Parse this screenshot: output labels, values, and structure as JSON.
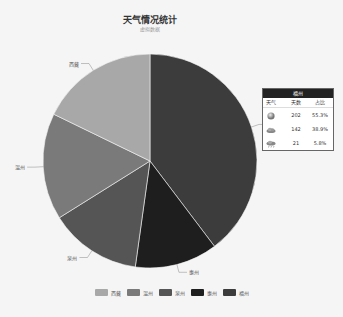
{
  "title": "天气情况统计",
  "subtitle": "虚拟数据",
  "chart_data": {
    "type": "pie",
    "title": "天气情况统计",
    "subtitle": "虚拟数据",
    "categories": [
      "福州",
      "惠州",
      "泉州",
      "温州",
      "西藏"
    ],
    "values": [
      39.7,
      12.5,
      13.9,
      16.1,
      17.8
    ],
    "colors": [
      "#3c3c3c",
      "#1e1e1e",
      "#555555",
      "#7a7a7a",
      "#a8a8a8"
    ],
    "legend": [
      "西藏",
      "温州",
      "泉州",
      "惠州",
      "福州"
    ],
    "legend_position": "bottom"
  },
  "tooltip": {
    "header": "福州",
    "columns": [
      "天气",
      "天数",
      "占比"
    ],
    "rows": [
      {
        "icon": "sun-icon",
        "days": "202",
        "pct": "55.3%"
      },
      {
        "icon": "cloud-icon",
        "days": "142",
        "pct": "38.9%"
      },
      {
        "icon": "rain-icon",
        "days": "21",
        "pct": "5.8%"
      }
    ]
  },
  "legend": [
    {
      "label": "西藏",
      "color": "#a8a8a8"
    },
    {
      "label": "温州",
      "color": "#7a7a7a"
    },
    {
      "label": "泉州",
      "color": "#555555"
    },
    {
      "label": "惠州",
      "color": "#1e1e1e"
    },
    {
      "label": "福州",
      "color": "#3c3c3c"
    }
  ]
}
